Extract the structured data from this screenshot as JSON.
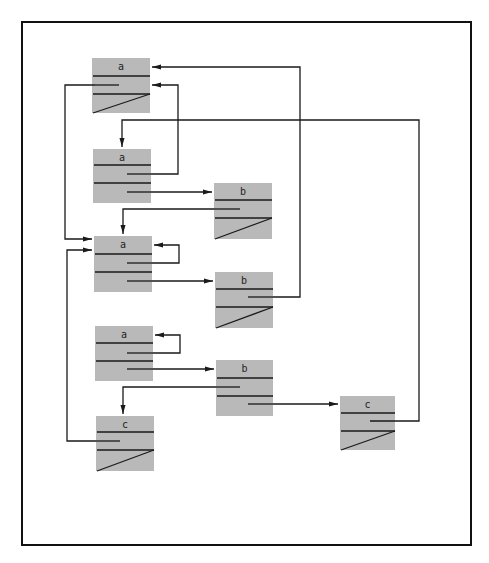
{
  "figure": {
    "type": "linked-structure-diagram",
    "colors": {
      "node_fill": "#b9b9b9",
      "line": "#1a1a1a",
      "frame": "#111111",
      "background": "#ffffff"
    }
  },
  "nodes": [
    {
      "id": "a1",
      "label": "a",
      "x": 92,
      "y": 58,
      "w": 58,
      "h": 55,
      "rows": [
        76,
        94
      ],
      "pointers": [
        {
          "y": 85,
          "x1": 95,
          "x2": 119
        }
      ],
      "nil_row": true
    },
    {
      "id": "a2",
      "label": "a",
      "x": 93,
      "y": 149,
      "w": 58,
      "h": 54,
      "rows": [
        165,
        183
      ],
      "pointers": [
        {
          "y": 174,
          "x1": 127,
          "x2": 151
        },
        {
          "y": 192,
          "x1": 127,
          "x2": 151
        }
      ],
      "nil_row": false
    },
    {
      "id": "b1",
      "label": "b",
      "x": 214,
      "y": 183,
      "w": 58,
      "h": 56,
      "rows": [
        200,
        218
      ],
      "pointers": [
        {
          "y": 209,
          "x1": 214,
          "x2": 240
        }
      ],
      "nil_row": true
    },
    {
      "id": "a3",
      "label": "a",
      "x": 94,
      "y": 236,
      "w": 58,
      "h": 56,
      "rows": [
        254,
        272
      ],
      "pointers": [
        {
          "y": 263,
          "x1": 127,
          "x2": 152
        },
        {
          "y": 281,
          "x1": 127,
          "x2": 152
        }
      ],
      "nil_row": false
    },
    {
      "id": "b2",
      "label": "b",
      "x": 215,
      "y": 272,
      "w": 58,
      "h": 56,
      "rows": [
        289,
        307
      ],
      "pointers": [
        {
          "y": 297,
          "x1": 248,
          "x2": 273
        }
      ],
      "nil_row": true
    },
    {
      "id": "a4",
      "label": "a",
      "x": 95,
      "y": 326,
      "w": 58,
      "h": 55,
      "rows": [
        343,
        361
      ],
      "pointers": [
        {
          "y": 353,
          "x1": 127,
          "x2": 153
        },
        {
          "y": 369,
          "x1": 127,
          "x2": 153
        }
      ],
      "nil_row": false
    },
    {
      "id": "b3",
      "label": "b",
      "x": 216,
      "y": 360,
      "w": 57,
      "h": 56,
      "rows": [
        378,
        396
      ],
      "pointers": [
        {
          "y": 387,
          "x1": 216,
          "x2": 240
        },
        {
          "y": 404,
          "x1": 248,
          "x2": 273
        }
      ],
      "nil_row": false
    },
    {
      "id": "c1",
      "label": "c",
      "x": 96,
      "y": 416,
      "w": 58,
      "h": 55,
      "rows": [
        432,
        450
      ],
      "pointers": [
        {
          "y": 441,
          "x1": 96,
          "x2": 120
        }
      ],
      "nil_row": true
    },
    {
      "id": "c2",
      "label": "c",
      "x": 340,
      "y": 396,
      "w": 55,
      "h": 54,
      "rows": [
        413,
        431
      ],
      "pointers": [
        {
          "y": 421,
          "x1": 370,
          "x2": 405
        }
      ],
      "nil_row": true
    }
  ],
  "edges": [
    {
      "from": "b2",
      "to": "a1",
      "points": [
        [
          273,
          297
        ],
        [
          300,
          297
        ],
        [
          300,
          67
        ],
        [
          152,
          67
        ]
      ],
      "arrow": "left"
    },
    {
      "from": "a2",
      "to": "a1",
      "points": [
        [
          151,
          174
        ],
        [
          178,
          174
        ],
        [
          178,
          85
        ],
        [
          152,
          85
        ]
      ],
      "arrow": "left"
    },
    {
      "from": "a1",
      "to": "a3",
      "points": [
        [
          95,
          85
        ],
        [
          65,
          85
        ],
        [
          65,
          239
        ],
        [
          92,
          239
        ]
      ],
      "arrow": "right"
    },
    {
      "from": "c2",
      "to": "a2",
      "points": [
        [
          405,
          421
        ],
        [
          419,
          421
        ],
        [
          419,
          120
        ],
        [
          122,
          120
        ],
        [
          122,
          147
        ]
      ],
      "arrow": "down"
    },
    {
      "from": "a2",
      "to": "b1",
      "points": [
        [
          151,
          192
        ],
        [
          212,
          192
        ]
      ],
      "arrow": "right"
    },
    {
      "from": "b1",
      "to": "a3",
      "points": [
        [
          214,
          209
        ],
        [
          123,
          209
        ],
        [
          123,
          234
        ]
      ],
      "arrow": "down"
    },
    {
      "from": "a3",
      "to": "a3",
      "points": [
        [
          152,
          263
        ],
        [
          179,
          263
        ],
        [
          179,
          245
        ],
        [
          154,
          245
        ]
      ],
      "arrow": "left"
    },
    {
      "from": "a3",
      "to": "b2",
      "points": [
        [
          152,
          281
        ],
        [
          213,
          281
        ]
      ],
      "arrow": "right"
    },
    {
      "from": "a4",
      "to": "a4",
      "points": [
        [
          153,
          353
        ],
        [
          180,
          353
        ],
        [
          180,
          335
        ],
        [
          155,
          335
        ]
      ],
      "arrow": "left"
    },
    {
      "from": "a4",
      "to": "b3",
      "points": [
        [
          153,
          369
        ],
        [
          214,
          369
        ]
      ],
      "arrow": "right"
    },
    {
      "from": "b3",
      "to": "c1",
      "points": [
        [
          216,
          387
        ],
        [
          123,
          387
        ],
        [
          123,
          414
        ]
      ],
      "arrow": "down"
    },
    {
      "from": "b3",
      "to": "c2",
      "points": [
        [
          273,
          404
        ],
        [
          338,
          404
        ]
      ],
      "arrow": "right"
    },
    {
      "from": "c1",
      "to": "a3",
      "points": [
        [
          96,
          441
        ],
        [
          67,
          441
        ],
        [
          67,
          250
        ],
        [
          92,
          250
        ]
      ],
      "arrow": "right"
    }
  ],
  "frame": {
    "x": 22,
    "y": 22,
    "w": 449,
    "h": 523
  }
}
